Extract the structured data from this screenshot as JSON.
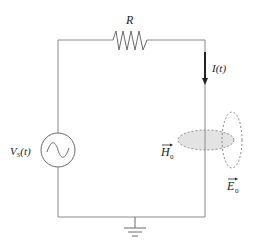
{
  "diagram": {
    "type": "circuit",
    "components": {
      "resistor": {
        "label": "R"
      },
      "source": {
        "label_main": "V",
        "label_sub": "S",
        "label_tail": "(t)",
        "symbol": "ac-sine"
      },
      "current": {
        "label": "I(t)",
        "direction": "down"
      },
      "ground": {
        "symbol": "ground"
      }
    },
    "fields": {
      "magnetic": {
        "label": "H",
        "sub": "0",
        "fill": "#e3e3e3"
      },
      "electric": {
        "label": "E",
        "sub": "0",
        "fill": "none"
      }
    }
  }
}
